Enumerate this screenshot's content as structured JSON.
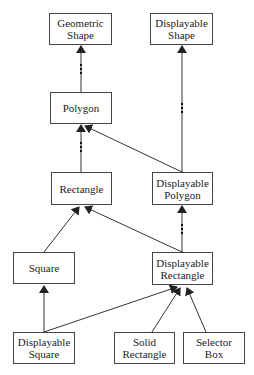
{
  "diagram": {
    "type": "class-hierarchy",
    "nodes": {
      "geometric_shape": {
        "line1": "Geometric",
        "line2": "Shape",
        "box": [
          49,
          13,
          63,
          32
        ]
      },
      "displayable_shape": {
        "line1": "Displayable",
        "line2": "Shape",
        "box": [
          150,
          13,
          63,
          32
        ]
      },
      "polygon": {
        "line1": "Polygon",
        "line2": "",
        "box": [
          50,
          92,
          62,
          32
        ]
      },
      "rectangle": {
        "line1": "Rectangle",
        "line2": "",
        "box": [
          51,
          172,
          61,
          33
        ]
      },
      "displayable_polygon": {
        "line1": "Displayable",
        "line2": "Polygon",
        "box": [
          152,
          172,
          61,
          33
        ]
      },
      "square": {
        "line1": "Square",
        "line2": "",
        "box": [
          13,
          252,
          62,
          32
        ]
      },
      "displayable_rectangle": {
        "line1": "Displayable",
        "line2": "Rectangle",
        "box": [
          152,
          252,
          61,
          33
        ]
      },
      "displayable_square": {
        "line1": "Displayable",
        "line2": "Square",
        "box": [
          13,
          332,
          62,
          32
        ]
      },
      "solid_rectangle": {
        "line1": "Solid",
        "line2": "Rectangle",
        "box": [
          114,
          332,
          61,
          32
        ]
      },
      "selector_box": {
        "line1": "Selector",
        "line2": "Box",
        "box": [
          183,
          332,
          62,
          32
        ]
      }
    },
    "edges": [
      {
        "from": "Polygon",
        "to": "Geometric Shape",
        "style": "ellipsis"
      },
      {
        "from": "Displayable Polygon",
        "to": "Displayable Shape",
        "style": "ellipsis"
      },
      {
        "from": "Rectangle",
        "to": "Polygon",
        "style": "ellipsis"
      },
      {
        "from": "Displayable Polygon",
        "to": "Polygon",
        "style": "solid"
      },
      {
        "from": "Square",
        "to": "Rectangle",
        "style": "solid"
      },
      {
        "from": "Displayable Rectangle",
        "to": "Rectangle",
        "style": "solid"
      },
      {
        "from": "Displayable Rectangle",
        "to": "Displayable Polygon",
        "style": "ellipsis"
      },
      {
        "from": "Displayable Square",
        "to": "Square",
        "style": "solid"
      },
      {
        "from": "Displayable Square",
        "to": "Displayable Rectangle",
        "style": "solid"
      },
      {
        "from": "Solid Rectangle",
        "to": "Displayable Rectangle",
        "style": "solid"
      },
      {
        "from": "Selector Box",
        "to": "Displayable Rectangle",
        "style": "solid"
      }
    ],
    "colors": {
      "line": "#333333",
      "border": "#444444",
      "background": "#ffffff"
    }
  }
}
